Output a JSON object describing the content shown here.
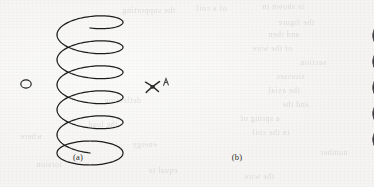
{
  "figure": {
    "canvas": {
      "width": 374,
      "height": 187
    },
    "background_color": "#f7f6f4",
    "paper_note": "scanned book page with faint reverse-side bleed-through"
  },
  "panels": [
    {
      "id": "a",
      "label": "(a)",
      "label_x": 58,
      "label_y": 153,
      "kind": "line-drawing",
      "subject": "helical coil spring outline",
      "stroke_color": "#1c1c1c",
      "turns": 5,
      "center_x": 90,
      "top_y": 16,
      "rx": 33,
      "ry": 12,
      "pitch": 25
    },
    {
      "id": "b",
      "label": "(b)",
      "label_x": 217,
      "label_y": 153,
      "kind": "shaded-3d-render",
      "subject": "helical coil spring solid tube",
      "tube_color_dark": "#2e2e30",
      "tube_color_mid": "#4a4a4d",
      "tube_color_light": "#6f6f73",
      "turns": 5,
      "center_x": 226,
      "top_y": 16,
      "rx": 35,
      "ry": 13,
      "pitch": 26,
      "tube_thickness": 11
    }
  ],
  "annotations": [
    {
      "name": "small-ellipse-marker",
      "shape": "ellipse",
      "x": 24,
      "y": 83,
      "rx": 5,
      "ry": 4,
      "stroke_color": "#1c1c1c"
    },
    {
      "name": "handwritten-x-mark",
      "glyph": "X",
      "x": 155,
      "y": 88,
      "color": "#2a2a2a"
    },
    {
      "name": "handwritten-caret-mark",
      "glyph": "A",
      "x": 167,
      "y": 79,
      "color": "#4a4a4a"
    }
  ],
  "bleed_through_text": [
    {
      "text": "the supporting",
      "x": 122,
      "y": 6,
      "size": 8
    },
    {
      "text": "of a coil",
      "x": 196,
      "y": 4,
      "size": 8
    },
    {
      "text": "is shown in",
      "x": 262,
      "y": 2,
      "size": 8
    },
    {
      "text": "the figure",
      "x": 278,
      "y": 18,
      "size": 8
    },
    {
      "text": "and then",
      "x": 268,
      "y": 30,
      "size": 8
    },
    {
      "text": "of the wire",
      "x": 252,
      "y": 44,
      "size": 8
    },
    {
      "text": "section",
      "x": 300,
      "y": 58,
      "size": 8
    },
    {
      "text": "stresses",
      "x": 276,
      "y": 72,
      "size": 8
    },
    {
      "text": "the axial",
      "x": 268,
      "y": 86,
      "size": 8
    },
    {
      "text": "and the",
      "x": 282,
      "y": 100,
      "size": 8
    },
    {
      "text": "a spring of",
      "x": 240,
      "y": 114,
      "size": 8
    },
    {
      "text": "in the coil",
      "x": 252,
      "y": 128,
      "size": 8
    },
    {
      "text": "deflection",
      "x": 104,
      "y": 96,
      "size": 8
    },
    {
      "text": "the load",
      "x": 88,
      "y": 120,
      "size": 8
    },
    {
      "text": "energy",
      "x": 132,
      "y": 140,
      "size": 8
    },
    {
      "text": "where",
      "x": 20,
      "y": 132,
      "size": 8
    },
    {
      "text": "torsion",
      "x": 36,
      "y": 160,
      "size": 8
    },
    {
      "text": "equal to",
      "x": 148,
      "y": 166,
      "size": 8
    },
    {
      "text": "the wire",
      "x": 244,
      "y": 172,
      "size": 8
    },
    {
      "text": "number",
      "x": 320,
      "y": 148,
      "size": 8
    }
  ]
}
